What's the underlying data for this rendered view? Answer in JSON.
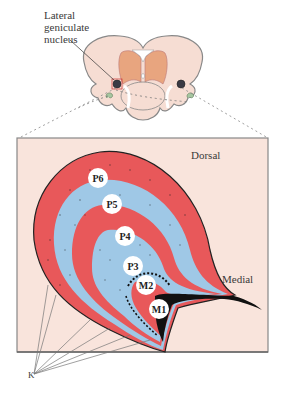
{
  "figure": {
    "overview_label": "Lateral\ngeniculate\nnucleus",
    "overview_label_lines": [
      "Lateral",
      "geniculate",
      "nucleus"
    ],
    "orientation": {
      "dorsal": "Dorsal",
      "medial": "Medial"
    },
    "layers": [
      {
        "id": "P6",
        "label": "P6",
        "type": "parvocellular",
        "color": "#e8585a"
      },
      {
        "id": "P5",
        "label": "P5",
        "type": "parvocellular",
        "color": "#9fc8e6"
      },
      {
        "id": "P4",
        "label": "P4",
        "type": "parvocellular",
        "color": "#e8585a"
      },
      {
        "id": "P3",
        "label": "P3",
        "type": "parvocellular",
        "color": "#9fc8e6"
      },
      {
        "id": "M2",
        "label": "M2",
        "type": "magnocellular",
        "color": "#9fc8e6"
      },
      {
        "id": "M1",
        "label": "M1",
        "type": "magnocellular",
        "color": "#e8585a"
      }
    ],
    "koniocellular_label": "K",
    "colors": {
      "background_panel": "#f9e4dc",
      "brain_tissue": "#f6ddd3",
      "thalamus": "#e8a57f",
      "red_layer": "#e8585a",
      "blue_layer": "#9fc8e6",
      "hilum": "#111111",
      "outline": "#555555"
    }
  }
}
